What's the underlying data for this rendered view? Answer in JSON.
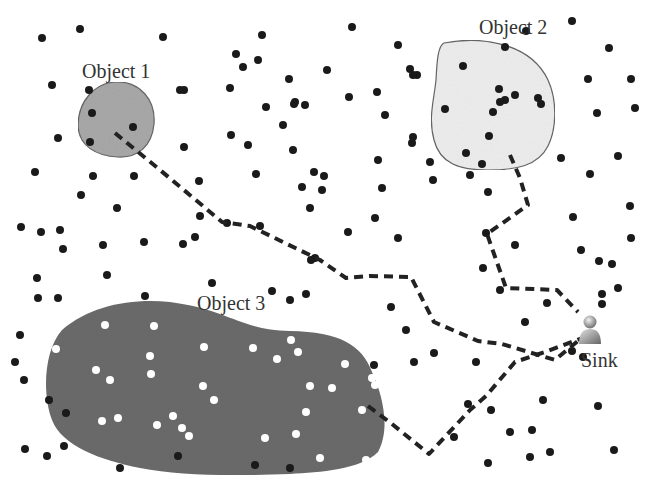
{
  "labels": {
    "object1": "Object 1",
    "object2": "Object 2",
    "object3": "Object 3",
    "sink": "Sink"
  },
  "colors": {
    "background": "#ffffff",
    "object1_fill": "#a9a9a9",
    "object2_fill": "#eeeeee",
    "object3_fill": "#6b6b6b",
    "outline": "#666666",
    "node": "#1a1a1a",
    "node_inside_object3": "#ffffff",
    "path": "#222222"
  },
  "objects": [
    {
      "id": "object1",
      "path": "M118,82 C140,82 156,100 154,124 C152,146 138,158 118,157 C96,156 79,146 78,126 C78,102 94,82 118,82 Z"
    },
    {
      "id": "object2",
      "path": "M444,43 C480,36 530,42 548,80 C558,102 556,130 548,146 C538,166 516,170 488,170 C460,170 440,164 434,140 C428,118 434,100 436,80 C437,60 438,46 444,43 Z"
    },
    {
      "id": "object3",
      "path": "M62,330 C90,306 130,298 170,302 C230,310 240,330 290,331 C340,332 362,345 372,372 C384,398 390,430 378,452 C360,470 320,472 290,474 C230,476 180,476 140,468 C100,460 62,446 52,420 C42,394 44,350 62,330 Z"
    }
  ],
  "nodes": [
    [
      42,
      38
    ],
    [
      80,
      29
    ],
    [
      163,
      37
    ],
    [
      52,
      85
    ],
    [
      184,
      90
    ],
    [
      58,
      138
    ],
    [
      184,
      147
    ],
    [
      35,
      172
    ],
    [
      93,
      176
    ],
    [
      134,
      176
    ],
    [
      199,
      181
    ],
    [
      81,
      195
    ],
    [
      117,
      208
    ],
    [
      200,
      216
    ],
    [
      183,
      244
    ],
    [
      21,
      227
    ],
    [
      41,
      232
    ],
    [
      60,
      230
    ],
    [
      63,
      249
    ],
    [
      103,
      245
    ],
    [
      144,
      242
    ],
    [
      195,
      237
    ],
    [
      37,
      278
    ],
    [
      107,
      275
    ],
    [
      38,
      298
    ],
    [
      145,
      296
    ],
    [
      262,
      35
    ],
    [
      352,
      27
    ],
    [
      236,
      54
    ],
    [
      243,
      67
    ],
    [
      258,
      60
    ],
    [
      289,
      79
    ],
    [
      327,
      70
    ],
    [
      230,
      88
    ],
    [
      295,
      102
    ],
    [
      180,
      90
    ],
    [
      266,
      107
    ],
    [
      294,
      104
    ],
    [
      305,
      105
    ],
    [
      349,
      97
    ],
    [
      377,
      92
    ],
    [
      410,
      69
    ],
    [
      417,
      75
    ],
    [
      398,
      45
    ],
    [
      413,
      75
    ],
    [
      385,
      115
    ],
    [
      231,
      135
    ],
    [
      248,
      145
    ],
    [
      283,
      125
    ],
    [
      293,
      150
    ],
    [
      314,
      172
    ],
    [
      324,
      176
    ],
    [
      378,
      160
    ],
    [
      430,
      162
    ],
    [
      433,
      180
    ],
    [
      470,
      175
    ],
    [
      256,
      174
    ],
    [
      348,
      232
    ],
    [
      375,
      218
    ],
    [
      398,
      238
    ],
    [
      315,
      258
    ],
    [
      311,
      260
    ],
    [
      272,
      291
    ],
    [
      290,
      300
    ],
    [
      306,
      294
    ],
    [
      413,
      137
    ],
    [
      412,
      143
    ],
    [
      505,
      47
    ],
    [
      505,
      100
    ],
    [
      382,
      188
    ],
    [
      302,
      187
    ],
    [
      310,
      208
    ],
    [
      322,
      190
    ],
    [
      227,
      223
    ],
    [
      260,
      226
    ],
    [
      212,
      283
    ],
    [
      89,
      90
    ],
    [
      92,
      113
    ],
    [
      133,
      127
    ],
    [
      90,
      142
    ],
    [
      463,
      66
    ],
    [
      499,
      89
    ],
    [
      515,
      95
    ],
    [
      500,
      102
    ],
    [
      445,
      109
    ],
    [
      493,
      112
    ],
    [
      538,
      98
    ],
    [
      541,
      104
    ],
    [
      489,
      136
    ],
    [
      466,
      153
    ],
    [
      482,
      164
    ],
    [
      526,
      31
    ],
    [
      572,
      21
    ],
    [
      609,
      48
    ],
    [
      588,
      79
    ],
    [
      631,
      79
    ],
    [
      597,
      113
    ],
    [
      635,
      108
    ],
    [
      561,
      158
    ],
    [
      618,
      156
    ],
    [
      590,
      174
    ],
    [
      630,
      206
    ],
    [
      573,
      217
    ],
    [
      581,
      250
    ],
    [
      599,
      261
    ],
    [
      618,
      288
    ],
    [
      602,
      294
    ],
    [
      547,
      303
    ],
    [
      602,
      304
    ],
    [
      543,
      400
    ],
    [
      598,
      406
    ],
    [
      530,
      457
    ],
    [
      550,
      452
    ],
    [
      614,
      450
    ],
    [
      631,
      238
    ],
    [
      612,
      264
    ],
    [
      515,
      245
    ],
    [
      525,
      322
    ],
    [
      488,
      192
    ],
    [
      483,
      268
    ],
    [
      500,
      290
    ],
    [
      486,
      233
    ],
    [
      20,
      335
    ],
    [
      49,
      400
    ],
    [
      25,
      449
    ],
    [
      47,
      456
    ],
    [
      66,
      413
    ],
    [
      64,
      446
    ],
    [
      58,
      298
    ],
    [
      15,
      362
    ],
    [
      24,
      380
    ],
    [
      120,
      468
    ],
    [
      178,
      456
    ],
    [
      255,
      465
    ],
    [
      290,
      468
    ],
    [
      374,
      365
    ],
    [
      391,
      307
    ],
    [
      406,
      330
    ],
    [
      414,
      362
    ],
    [
      434,
      353
    ],
    [
      476,
      362
    ],
    [
      454,
      437
    ],
    [
      510,
      432
    ],
    [
      532,
      430
    ],
    [
      468,
      404
    ],
    [
      491,
      410
    ],
    [
      488,
      463
    ],
    [
      572,
      351
    ],
    [
      583,
      357
    ]
  ],
  "white_nodes": [
    [
      105,
      325
    ],
    [
      96,
      370
    ],
    [
      110,
      380
    ],
    [
      150,
      356
    ],
    [
      204,
      347
    ],
    [
      151,
      374
    ],
    [
      154,
      326
    ],
    [
      203,
      386
    ],
    [
      253,
      348
    ],
    [
      291,
      340
    ],
    [
      298,
      352
    ],
    [
      277,
      359
    ],
    [
      310,
      386
    ],
    [
      306,
      412
    ],
    [
      265,
      438
    ],
    [
      296,
      434
    ],
    [
      214,
      400
    ],
    [
      182,
      428
    ],
    [
      173,
      416
    ],
    [
      118,
      418
    ],
    [
      102,
      421
    ],
    [
      157,
      425
    ],
    [
      189,
      436
    ],
    [
      320,
      458
    ],
    [
      362,
      410
    ],
    [
      356,
      296
    ],
    [
      372,
      378
    ],
    [
      375,
      385
    ],
    [
      366,
      460
    ],
    [
      345,
      364
    ],
    [
      332,
      388
    ],
    [
      56,
      349
    ]
  ],
  "routes": [
    {
      "id": "route-object1",
      "points": [
        [
          115,
          133
        ],
        [
          160,
          170
        ],
        [
          222,
          222
        ],
        [
          250,
          226
        ],
        [
          320,
          260
        ],
        [
          346,
          278
        ],
        [
          370,
          276
        ],
        [
          411,
          277
        ],
        [
          434,
          322
        ],
        [
          478,
          341
        ],
        [
          502,
          344
        ],
        [
          555,
          360
        ],
        [
          585,
          335
        ]
      ]
    },
    {
      "id": "route-object2",
      "points": [
        [
          510,
          155
        ],
        [
          520,
          178
        ],
        [
          528,
          205
        ],
        [
          487,
          234
        ],
        [
          506,
          288
        ],
        [
          557,
          290
        ],
        [
          578,
          312
        ]
      ]
    },
    {
      "id": "route-object3",
      "points": [
        [
          368,
          406
        ],
        [
          392,
          424
        ],
        [
          429,
          454
        ],
        [
          470,
          410
        ],
        [
          486,
          396
        ],
        [
          515,
          362
        ],
        [
          545,
          352
        ],
        [
          585,
          337
        ]
      ]
    }
  ],
  "label_positions": {
    "object1": [
      82,
      78
    ],
    "object2": [
      479,
      34
    ],
    "object3": [
      197,
      310
    ],
    "sink": [
      581,
      367
    ]
  },
  "sink_icon": {
    "name": "person-icon",
    "x": 590,
    "y": 330
  }
}
